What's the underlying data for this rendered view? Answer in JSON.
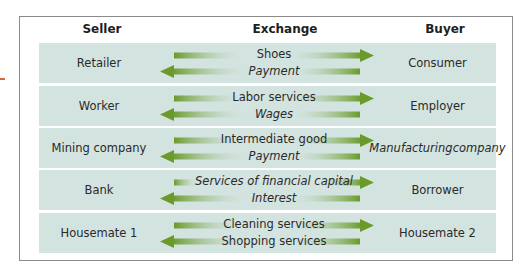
{
  "figure": {
    "headers": {
      "seller": "Seller",
      "exchange": "Exchange",
      "buyer": "Buyer"
    },
    "colors": {
      "row_background": "#d3e3e0",
      "arrow_green": "#6a9a2a",
      "arrow_fade": "#d3e3e0",
      "frame_border": "#8a8a8a",
      "accent_mark": "#e0623a"
    },
    "rows": [
      {
        "seller": "Retailer",
        "to_buyer": "Shoes",
        "to_buyer_italic": false,
        "to_seller": "Payment",
        "to_seller_italic": true,
        "buyer": "Consumer",
        "buyer_italic": false
      },
      {
        "seller": "Worker",
        "to_buyer": "Labor services",
        "to_buyer_italic": false,
        "to_seller": "Wages",
        "to_seller_italic": true,
        "buyer": "Employer",
        "buyer_italic": false
      },
      {
        "seller": "Mining company",
        "to_buyer": "Intermediate good",
        "to_buyer_italic": false,
        "to_seller": "Payment",
        "to_seller_italic": true,
        "buyer": "Manufacturing company",
        "buyer_line1": "Manufacturing",
        "buyer_line2": "company",
        "buyer_italic": true
      },
      {
        "seller": "Bank",
        "to_buyer": "Services of financial capital",
        "to_buyer_italic": true,
        "to_seller": "Interest",
        "to_seller_italic": true,
        "buyer": "Borrower",
        "buyer_italic": false
      },
      {
        "seller": "Housemate 1",
        "to_buyer": "Cleaning services",
        "to_buyer_italic": false,
        "to_seller": "Shopping services",
        "to_seller_italic": false,
        "buyer": "Housemate 2",
        "buyer_italic": false
      }
    ]
  }
}
